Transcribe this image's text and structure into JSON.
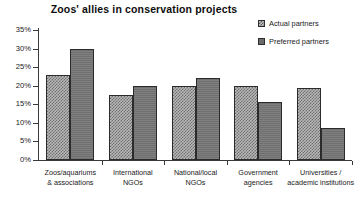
{
  "chart_data": {
    "type": "bar",
    "title": "Zoos' allies in conservation projects",
    "xlabel": "",
    "ylabel": "",
    "ylim": [
      0,
      35
    ],
    "y_unit": "%",
    "grid": false,
    "legend_position": "top-right",
    "categories": [
      "Zoos/aquariums & associations",
      "International NGOs",
      "National/local NGOs",
      "Government agencies",
      "Universities / academic institutions"
    ],
    "category_lines": [
      [
        "Zoos/aquariums",
        "& associations"
      ],
      [
        "International",
        "NGOs"
      ],
      [
        "National/local",
        "NGOs"
      ],
      [
        "Government",
        "agencies"
      ],
      [
        "Universities /",
        "academic institutions"
      ]
    ],
    "series": [
      {
        "name": "Actual partners",
        "values": [
          23,
          17.5,
          20,
          20,
          19.5
        ],
        "fill": "checkered-light",
        "color": "#b8b8b8"
      },
      {
        "name": "Preferred partners",
        "values": [
          30,
          20,
          22,
          15.5,
          8.5
        ],
        "fill": "solid-gray",
        "color": "#707070"
      }
    ],
    "y_ticks": [
      {
        "value": 0,
        "label": "0%"
      },
      {
        "value": 5,
        "label": "5%"
      },
      {
        "value": 10,
        "label": "10%"
      },
      {
        "value": 15,
        "label": "15%"
      },
      {
        "value": 20,
        "label": "20%"
      },
      {
        "value": 25,
        "label": "25%"
      },
      {
        "value": 30,
        "label": "30%"
      },
      {
        "value": 35,
        "label": "35%"
      }
    ]
  },
  "legend": {
    "items": [
      {
        "label": "Actual partners"
      },
      {
        "label": "Preferred partners"
      }
    ]
  }
}
